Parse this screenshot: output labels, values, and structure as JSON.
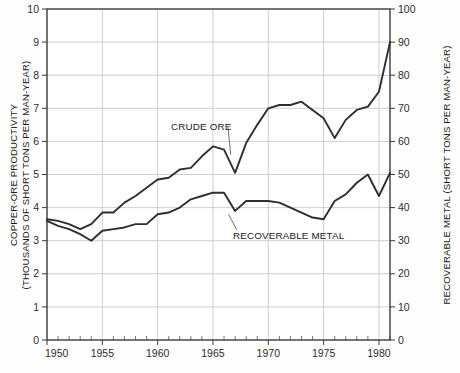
{
  "chart_data": {
    "type": "line",
    "title": "",
    "xlabel": "",
    "ylabel": "COPPER-ORE PRODUCTIVITY (THOUSANDS OF SHORT TONS PER MAN-YEAR)",
    "y2label": "RECOVERABLE METAL (SHORT TONS PER MAN-YEAR)",
    "xlim": [
      1950,
      1981
    ],
    "ylim": [
      0,
      10
    ],
    "y2lim": [
      0,
      100
    ],
    "grid": true,
    "legend_position": "inline-annotation",
    "x_ticks": [
      1950,
      1955,
      1960,
      1965,
      1970,
      1975,
      1980
    ],
    "x_tick_labels": [
      "1950",
      "1955",
      "1960",
      "1965",
      "1970",
      "1975",
      "1980"
    ],
    "x_minor_ticks": [
      1951,
      1952,
      1953,
      1954,
      1956,
      1957,
      1958,
      1959,
      1961,
      1962,
      1963,
      1964,
      1966,
      1967,
      1968,
      1969,
      1971,
      1972,
      1973,
      1974,
      1976,
      1977,
      1978,
      1979,
      1981
    ],
    "y_ticks": [
      0,
      1,
      2,
      3,
      4,
      5,
      6,
      7,
      8,
      9,
      10
    ],
    "y_tick_labels": [
      "0",
      "1",
      "2",
      "3",
      "4",
      "5",
      "6",
      "7",
      "8",
      "9",
      "10"
    ],
    "y2_ticks": [
      0,
      10,
      20,
      30,
      40,
      50,
      60,
      70,
      80,
      90,
      100
    ],
    "y2_tick_labels": [
      "0",
      "10",
      "20",
      "30",
      "40",
      "50",
      "60",
      "70",
      "80",
      "90",
      "100"
    ],
    "x": [
      1950,
      1951,
      1952,
      1953,
      1954,
      1955,
      1956,
      1957,
      1958,
      1959,
      1960,
      1961,
      1962,
      1963,
      1964,
      1965,
      1966,
      1967,
      1968,
      1969,
      1970,
      1971,
      1972,
      1973,
      1974,
      1975,
      1976,
      1977,
      1978,
      1979,
      1980,
      1981
    ],
    "series": [
      {
        "name": "CRUDE ORE",
        "axis": "left",
        "color": "#2e2e2e",
        "values": [
          3.65,
          3.6,
          3.5,
          3.35,
          3.5,
          3.85,
          3.85,
          4.15,
          4.35,
          4.6,
          4.85,
          4.9,
          5.15,
          5.2,
          5.55,
          5.85,
          5.75,
          5.05,
          5.95,
          6.5,
          7.0,
          7.1,
          7.1,
          7.2,
          6.95,
          6.7,
          6.1,
          6.65,
          6.95,
          7.05,
          7.5,
          9.0
        ]
      },
      {
        "name": "RECOVERABLE METAL",
        "axis": "right",
        "color": "#2e2e2e",
        "values": [
          3.6,
          3.45,
          3.35,
          3.2,
          3.0,
          3.3,
          3.35,
          3.4,
          3.5,
          3.5,
          3.8,
          3.85,
          4.0,
          4.25,
          4.35,
          4.45,
          4.45,
          3.9,
          4.2,
          4.2,
          4.2,
          4.15,
          4.0,
          3.85,
          3.7,
          3.65,
          4.2,
          4.4,
          4.75,
          5.0,
          4.35,
          5.05
        ]
      }
    ],
    "annotations": [
      {
        "text": "CRUDE ORE",
        "x": 1961.2,
        "y": 6.35,
        "leader_to_x": 1966.6,
        "leader_to_y": 5.6
      },
      {
        "text": "RECOVERABLE METAL",
        "x": 1966.8,
        "y": 3.05,
        "leader_to_x": 1966.4,
        "leader_to_y": 3.8
      }
    ]
  }
}
